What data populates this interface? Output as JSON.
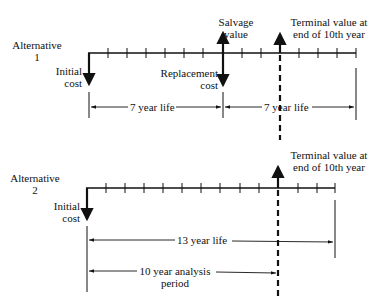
{
  "alt1": {
    "label_line1": "Alternative",
    "label_line2": "1",
    "initial_cost_line1": "Initial",
    "initial_cost_line2": "cost",
    "replacement_line1": "Replacement",
    "replacement_line2": "cost",
    "salvage_line1": "Salvage",
    "salvage_line2": "value",
    "terminal_line1": "Terminal value at",
    "terminal_line2": "end of 10th year",
    "life1": "7 year life",
    "life2": "7 year life"
  },
  "alt2": {
    "label_line1": "Alternative",
    "label_line2": "2",
    "initial_cost_line1": "Initial",
    "initial_cost_line2": "cost",
    "terminal_line1": "Terminal value at",
    "terminal_line2": "end of 10th year",
    "life": "13 year life",
    "analysis_line1": "10 year analysis",
    "analysis_line2": "period"
  }
}
